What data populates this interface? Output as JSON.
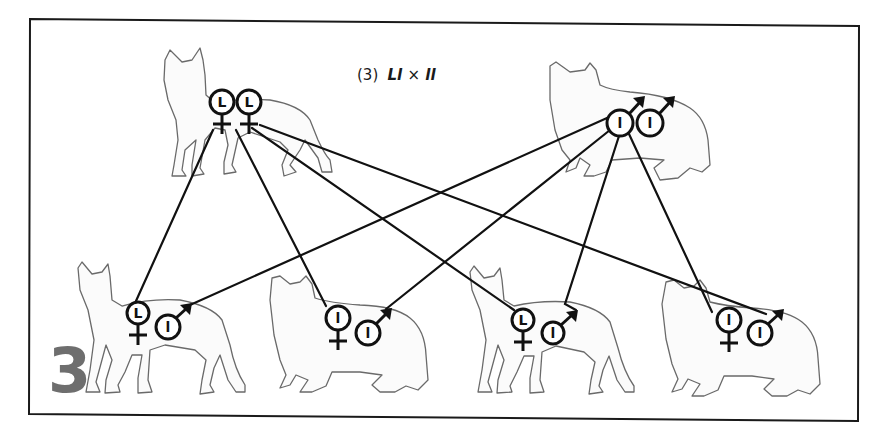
{
  "diagram": {
    "panel_number": "3",
    "title": {
      "number": "(3)",
      "cross_female": "Ll",
      "cross_times": "×",
      "cross_male": "ll",
      "display": "(3) Ll × ll"
    },
    "colors": {
      "frame": "#1a1a1a",
      "lines": "#111111",
      "cat_outline": "#6a6a6a",
      "panel_number": "#6e6e6e"
    },
    "parents": [
      {
        "id": "parent-female",
        "role": "mother",
        "cat_type": "shorthair",
        "genotype": "Ll",
        "gametes": [
          {
            "sex": "female",
            "allele": "L"
          },
          {
            "sex": "female",
            "allele": "L"
          }
        ]
      },
      {
        "id": "parent-male",
        "role": "father",
        "cat_type": "longhair",
        "genotype": "ll",
        "gametes": [
          {
            "sex": "male",
            "allele": "l"
          },
          {
            "sex": "male",
            "allele": "l"
          }
        ]
      }
    ],
    "offspring": [
      {
        "id": "kitten-1",
        "cat_type": "shorthair",
        "female_allele": "L",
        "male_allele": "l",
        "genotype": "Ll"
      },
      {
        "id": "kitten-2",
        "cat_type": "longhair",
        "female_allele": "l",
        "male_allele": "l",
        "genotype": "ll"
      },
      {
        "id": "kitten-3",
        "cat_type": "shorthair",
        "female_allele": "L",
        "male_allele": "l",
        "genotype": "Ll"
      },
      {
        "id": "kitten-4",
        "cat_type": "longhair",
        "female_allele": "l",
        "male_allele": "l",
        "genotype": "ll"
      }
    ],
    "connections": [
      {
        "from": "parent-female",
        "to": "kitten-1"
      },
      {
        "from": "parent-female",
        "to": "kitten-2"
      },
      {
        "from": "parent-female",
        "to": "kitten-3"
      },
      {
        "from": "parent-female",
        "to": "kitten-4"
      },
      {
        "from": "parent-male",
        "to": "kitten-1"
      },
      {
        "from": "parent-male",
        "to": "kitten-2"
      },
      {
        "from": "parent-male",
        "to": "kitten-3"
      },
      {
        "from": "parent-male",
        "to": "kitten-4"
      }
    ]
  }
}
